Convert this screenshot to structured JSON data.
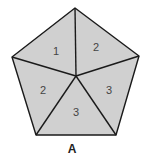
{
  "diagram": {
    "shape": "pentagon",
    "fill_color": "#d0d0d0",
    "stroke_color": "#1a1a1a",
    "regions": [
      {
        "label": "1"
      },
      {
        "label": "2"
      },
      {
        "label": "2"
      },
      {
        "label": "3"
      },
      {
        "label": "3"
      }
    ],
    "caption": "A"
  }
}
